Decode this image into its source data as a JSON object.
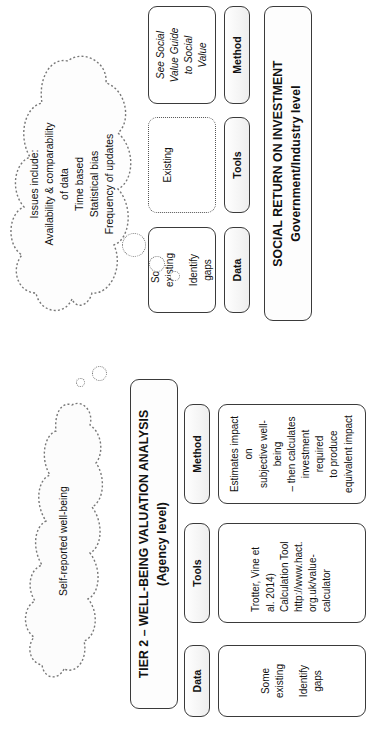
{
  "document": {
    "orientation": "rotated-90-ccw",
    "background_color": "#ffffff",
    "line_color": "#3a3a3a"
  },
  "tier2": {
    "title": "TIER 2 – WELL-BEING VALUATION ANALYSIS (Agency level)",
    "columns": [
      {
        "header": "Method",
        "body_lines": [
          "Estimates impact on",
          "subjective well-being",
          "– then calculates",
          "investment required",
          "to produce",
          "equivalent impact"
        ],
        "dashed": false,
        "italic": false
      },
      {
        "header": "Tools",
        "body_lines": [
          "Trotter, Vine et",
          "al. 2014)",
          "Calculation Tool",
          "http://www.hact.",
          "org.uk/value-",
          "calculator"
        ],
        "dashed": false,
        "italic": false
      },
      {
        "header": "Data",
        "body_paragraphs": [
          [
            "Some",
            "existing"
          ],
          [
            "Identify",
            "gaps"
          ]
        ],
        "dashed": false,
        "italic": false
      }
    ],
    "cloud": {
      "lines": [
        "Self-reported well-being"
      ],
      "bubbles": 2
    }
  },
  "sroi": {
    "title_line1": "SOCIAL RETURN ON INVESTMENT",
    "title_line2": "Government/Industry level",
    "columns": [
      {
        "header": "Method",
        "body_lines": [
          "See Social",
          "Value Guide",
          "to Social",
          "Value"
        ],
        "dashed": false,
        "italic": true
      },
      {
        "header": "Tools",
        "body_lines": [
          "Existing"
        ],
        "dashed": true,
        "italic": false
      },
      {
        "header": "Data",
        "body_paragraphs": [
          [
            "Some",
            "existing"
          ],
          [
            "Identify",
            "gaps"
          ]
        ],
        "dashed": false,
        "italic": false
      }
    ],
    "cloud": {
      "lines": [
        "Issues include:",
        "Availability & comparability",
        "of data",
        "Time based",
        "Statistical bias",
        "Frequency of updates"
      ],
      "bubbles": 3
    }
  }
}
